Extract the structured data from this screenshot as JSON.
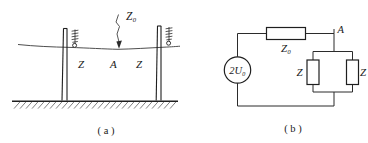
{
  "figure": {
    "panels": [
      {
        "id": "panel-a",
        "caption": "( a )",
        "description": "Transmission line suspended between two towers over ground",
        "labels": {
          "line_impedance": "Z₀",
          "left_section": "Z",
          "node": "A",
          "right_section": "Z"
        }
      },
      {
        "id": "panel-b",
        "caption": "( b )",
        "description": "Equivalent circuit with source, series impedance and two parallel impedances",
        "labels": {
          "source": "2U₀",
          "series_impedance": "Z₀",
          "node": "A",
          "left_branch": "Z",
          "right_branch": "Z"
        }
      }
    ],
    "colors": {
      "ink": "#1f1f1f",
      "line": "#2b2b2b",
      "wire": "#3a3a3a",
      "paper": "#ffffff"
    }
  }
}
